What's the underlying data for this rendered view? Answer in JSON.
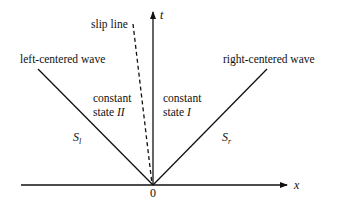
{
  "diagram": {
    "type": "wave-interaction-xt-diagram",
    "axes": {
      "x_label": "x",
      "t_label": "t",
      "origin_label": "0"
    },
    "labels": {
      "slip_line": "slip line",
      "left_wave": "left-centered wave",
      "right_wave": "right-centered wave",
      "state_II_line1": "constant",
      "state_II_line2_prefix": "state ",
      "state_II_line2_roman": "II",
      "state_I_line1": "constant",
      "state_I_line2_prefix": "state ",
      "state_I_line2_roman": "I",
      "S_l_base": "S",
      "S_l_sub": "l",
      "S_r_base": "S",
      "S_r_sub": "r"
    },
    "colors": {
      "line": "#111111",
      "background": "#ffffff"
    }
  }
}
